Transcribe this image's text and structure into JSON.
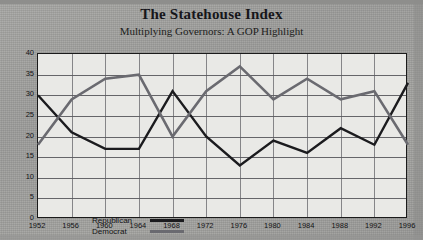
{
  "header": {
    "title": "The Statehouse Index",
    "subtitle": "Multiplying Governors: A GOP Highlight"
  },
  "legend": {
    "republican_label": "Republican",
    "democrat_label": "Democrat"
  },
  "colors": {
    "republican": "#1b1b1e",
    "democrat": "#6a6a70",
    "plot_background": "#e9e9e6",
    "page_background": "#9d9d9b",
    "gridline": "#4d4d52",
    "axis": "#1a1a1a"
  },
  "chart_data": {
    "type": "line",
    "title": "The Statehouse Index",
    "subtitle": "Multiplying Governors: A GOP Highlight",
    "xlabel": "",
    "ylabel": "",
    "x": [
      1952,
      1956,
      1960,
      1964,
      1968,
      1972,
      1976,
      1980,
      1984,
      1988,
      1992,
      1996
    ],
    "categories": [
      "1952",
      "1956",
      "1960",
      "1964",
      "1968",
      "1972",
      "1976",
      "1980",
      "1984",
      "1988",
      "1992",
      "1996"
    ],
    "xlim": [
      1952,
      1996
    ],
    "ylim": [
      0,
      40
    ],
    "yticks": [
      0,
      5,
      10,
      15,
      20,
      25,
      30,
      35,
      40
    ],
    "grid": true,
    "legend_position": "inside-lower-left",
    "series": [
      {
        "name": "Republican",
        "color": "#1b1b1e",
        "values": [
          30,
          21,
          17,
          17,
          31,
          20,
          13,
          19,
          16,
          22,
          18,
          33
        ]
      },
      {
        "name": "Democrat",
        "color": "#6a6a70",
        "values": [
          18,
          29,
          34,
          35,
          20,
          31,
          37,
          29,
          34,
          29,
          31,
          18
        ]
      }
    ]
  }
}
